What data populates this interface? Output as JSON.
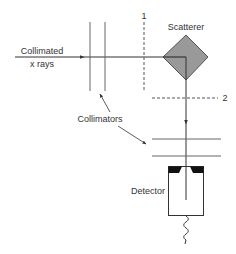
{
  "diagram": {
    "type": "x-ray scattering setup",
    "labels": {
      "incoming_line1": "Collimated",
      "incoming_line2": "x rays",
      "scatterer": "Scatterer",
      "collimators": "Collimators",
      "detector": "Detector",
      "plane1": "1",
      "plane2": "2"
    },
    "colors": {
      "line": "#333333",
      "scatterer_fill": "#999999",
      "detector_cap": "#111111",
      "background": "#ffffff"
    }
  }
}
